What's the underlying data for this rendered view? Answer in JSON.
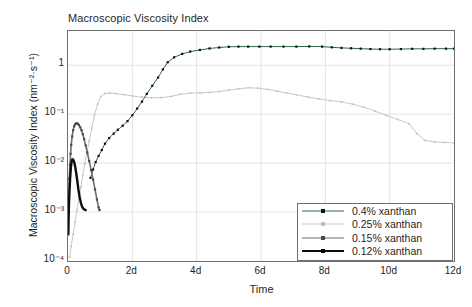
{
  "chart_data": {
    "type": "line",
    "title": "Macroscopic Viscosity Index",
    "xlabel": "Time",
    "ylabel": "Macroscopic Viscosity Index (nm⁻²·s⁻¹)",
    "xlim": [
      0,
      12
    ],
    "ylim": [
      0.0001,
      5
    ],
    "yscale": "log",
    "grid": true,
    "legend_position": "bottom-right",
    "xticks": [
      0,
      2,
      4,
      6,
      8,
      10,
      12
    ],
    "xticklabels": [
      "0",
      "2d",
      "4d",
      "6d",
      "8d",
      "10d",
      "12d"
    ],
    "yticks": [
      1,
      0.1,
      0.01,
      0.001,
      0.0001
    ],
    "yticklabels": [
      "1",
      "10⁻¹",
      "10⁻²",
      "10⁻³",
      "10⁻⁴"
    ],
    "series": [
      {
        "name": "0.4% xanthan",
        "color": "#2d6a42",
        "marker_color": "#111111",
        "linewidth": 1.0,
        "x": [
          0.7,
          0.78,
          0.86,
          0.95,
          1.05,
          1.15,
          1.28,
          1.42,
          1.55,
          1.7,
          1.85,
          2.0,
          2.15,
          2.3,
          2.45,
          2.62,
          2.8,
          2.95,
          3.1,
          3.3,
          3.55,
          3.8,
          4.1,
          4.4,
          4.7,
          5.0,
          5.3,
          5.6,
          5.95,
          6.3,
          6.7,
          7.1,
          7.5,
          7.9,
          8.2,
          8.5,
          8.8,
          9.1,
          9.4,
          9.7,
          10.0,
          10.35,
          10.7,
          11.05,
          11.4,
          11.75,
          12.0
        ],
        "y": [
          0.005,
          0.0074,
          0.0105,
          0.014,
          0.0185,
          0.025,
          0.0325,
          0.04,
          0.048,
          0.058,
          0.072,
          0.095,
          0.13,
          0.18,
          0.26,
          0.38,
          0.56,
          0.82,
          1.15,
          1.45,
          1.7,
          1.9,
          2.05,
          2.2,
          2.3,
          2.38,
          2.4,
          2.4,
          2.4,
          2.4,
          2.4,
          2.4,
          2.42,
          2.4,
          2.32,
          2.26,
          2.22,
          2.18,
          2.14,
          2.12,
          2.12,
          2.14,
          2.16,
          2.16,
          2.18,
          2.18,
          2.18
        ]
      },
      {
        "name": "0.25% xanthan",
        "color": "#c9c9c9",
        "marker_color": "#bdbdbd",
        "linewidth": 1.0,
        "x": [
          0.05,
          0.1,
          0.16,
          0.22,
          0.28,
          0.34,
          0.4,
          0.46,
          0.52,
          0.58,
          0.66,
          0.74,
          0.82,
          0.92,
          1.02,
          1.15,
          1.3,
          1.5,
          1.75,
          2.0,
          2.3,
          2.6,
          2.9,
          3.2,
          3.5,
          3.8,
          4.1,
          4.4,
          4.7,
          5.0,
          5.3,
          5.6,
          5.9,
          6.2,
          6.5,
          6.8,
          7.1,
          7.45,
          7.8,
          8.15,
          8.5,
          8.85,
          9.2,
          9.55,
          9.9,
          10.25,
          10.6,
          10.85,
          11.1,
          11.4,
          11.7,
          12.0
        ],
        "y": [
          0.00012,
          0.0002,
          0.00035,
          0.00062,
          0.0011,
          0.0019,
          0.0032,
          0.0056,
          0.0095,
          0.016,
          0.028,
          0.052,
          0.095,
          0.16,
          0.23,
          0.265,
          0.27,
          0.262,
          0.25,
          0.235,
          0.222,
          0.215,
          0.218,
          0.23,
          0.255,
          0.27,
          0.272,
          0.278,
          0.29,
          0.31,
          0.33,
          0.345,
          0.34,
          0.32,
          0.295,
          0.27,
          0.248,
          0.225,
          0.205,
          0.19,
          0.178,
          0.16,
          0.138,
          0.115,
          0.094,
          0.078,
          0.064,
          0.04,
          0.029,
          0.0272,
          0.0265,
          0.0258
        ]
      },
      {
        "name": "0.15% xanthan",
        "color": "#6e6e6e",
        "marker_color": "#4a4a4a",
        "linewidth": 1.6,
        "x": [
          0.02,
          0.04,
          0.06,
          0.08,
          0.1,
          0.13,
          0.16,
          0.19,
          0.22,
          0.26,
          0.3,
          0.34,
          0.38,
          0.42,
          0.46,
          0.5,
          0.55,
          0.6,
          0.66,
          0.72,
          0.78,
          0.84,
          0.9,
          0.95,
          0.98
        ],
        "y": [
          0.0022,
          0.0048,
          0.0092,
          0.0155,
          0.0235,
          0.035,
          0.047,
          0.0565,
          0.062,
          0.065,
          0.064,
          0.06,
          0.054,
          0.047,
          0.039,
          0.031,
          0.023,
          0.0165,
          0.011,
          0.0072,
          0.0046,
          0.0029,
          0.0018,
          0.00125,
          0.0011
        ]
      },
      {
        "name": "0.12% xanthan",
        "color": "#0d0d0d",
        "marker_color": "#000000",
        "linewidth": 2.4,
        "x": [
          0.01,
          0.02,
          0.03,
          0.05,
          0.07,
          0.09,
          0.11,
          0.13,
          0.15,
          0.17,
          0.2,
          0.23,
          0.26,
          0.29,
          0.32,
          0.36,
          0.4,
          0.44,
          0.48,
          0.52,
          0.55
        ],
        "y": [
          0.00035,
          0.00075,
          0.0015,
          0.003,
          0.0054,
          0.0082,
          0.0105,
          0.0118,
          0.012,
          0.0115,
          0.01,
          0.008,
          0.006,
          0.0043,
          0.003,
          0.00205,
          0.00155,
          0.00128,
          0.00116,
          0.00112,
          0.0011
        ]
      }
    ]
  },
  "colors": {
    "frame": "#6f6f6f",
    "grid": "#e3e3e3",
    "background": "#ffffff",
    "text": "#1f1f1f"
  }
}
